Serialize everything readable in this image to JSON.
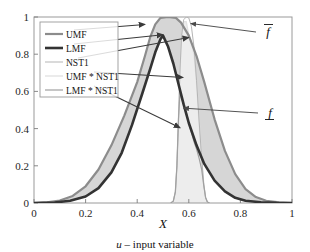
{
  "chart_data": {
    "type": "area",
    "title": "",
    "subtitle": "",
    "xlabel": "X",
    "ylabel": "",
    "caption": "u – input variable",
    "caption_symbol": "u",
    "caption_rest": " – input variable",
    "xlim": [
      0,
      1
    ],
    "ylim": [
      0,
      1
    ],
    "xticks": [
      "0",
      "0.2",
      "0.4",
      "0.6",
      "0.8",
      "1"
    ],
    "xtick_values": [
      0,
      0.2,
      0.4,
      0.6,
      0.8,
      1
    ],
    "yticks": [
      "0",
      "0.2",
      "0.4",
      "0.6",
      "0.8",
      "1"
    ],
    "ytick_values": [
      0,
      0.2,
      0.4,
      0.6,
      0.8,
      1
    ],
    "grid": false,
    "legend_position": "upper-left",
    "fou_fill": "#d6d6d6",
    "series": [
      {
        "name": "UMF",
        "color": "#8c8c8c",
        "width": 2.2,
        "points": [
          [
            0.0,
            0.0
          ],
          [
            0.05,
            0.004
          ],
          [
            0.1,
            0.013
          ],
          [
            0.15,
            0.038
          ],
          [
            0.2,
            0.09
          ],
          [
            0.25,
            0.18
          ],
          [
            0.3,
            0.31
          ],
          [
            0.35,
            0.47
          ],
          [
            0.4,
            0.65
          ],
          [
            0.43,
            0.79
          ],
          [
            0.45,
            0.89
          ],
          [
            0.47,
            0.96
          ],
          [
            0.49,
            0.995
          ],
          [
            0.52,
            1.0
          ],
          [
            0.55,
            0.995
          ],
          [
            0.57,
            0.97
          ],
          [
            0.6,
            0.9
          ],
          [
            0.63,
            0.79
          ],
          [
            0.66,
            0.65
          ],
          [
            0.7,
            0.45
          ],
          [
            0.74,
            0.28
          ],
          [
            0.78,
            0.155
          ],
          [
            0.82,
            0.075
          ],
          [
            0.86,
            0.032
          ],
          [
            0.9,
            0.012
          ],
          [
            0.95,
            0.003
          ],
          [
            1.0,
            0.0
          ]
        ]
      },
      {
        "name": "LMF",
        "color": "#333333",
        "width": 2.6,
        "points": [
          [
            0.0,
            0.0
          ],
          [
            0.08,
            0.003
          ],
          [
            0.14,
            0.012
          ],
          [
            0.2,
            0.035
          ],
          [
            0.25,
            0.08
          ],
          [
            0.3,
            0.165
          ],
          [
            0.34,
            0.27
          ],
          [
            0.38,
            0.42
          ],
          [
            0.42,
            0.59
          ],
          [
            0.45,
            0.72
          ],
          [
            0.47,
            0.81
          ],
          [
            0.49,
            0.88
          ],
          [
            0.5,
            0.9
          ],
          [
            0.52,
            0.84
          ],
          [
            0.54,
            0.75
          ],
          [
            0.56,
            0.64
          ],
          [
            0.58,
            0.53
          ],
          [
            0.6,
            0.43
          ],
          [
            0.63,
            0.31
          ],
          [
            0.66,
            0.21
          ],
          [
            0.7,
            0.12
          ],
          [
            0.74,
            0.062
          ],
          [
            0.78,
            0.028
          ],
          [
            0.82,
            0.012
          ],
          [
            0.88,
            0.004
          ],
          [
            0.94,
            0.001
          ],
          [
            1.0,
            0.0
          ]
        ]
      },
      {
        "name": "NST1",
        "color": "#b5b5b5",
        "width": 1.0,
        "points": [
          [
            0.53,
            0.0
          ],
          [
            0.54,
            0.01
          ],
          [
            0.548,
            0.06
          ],
          [
            0.554,
            0.2
          ],
          [
            0.56,
            0.45
          ],
          [
            0.566,
            0.72
          ],
          [
            0.572,
            0.9
          ],
          [
            0.58,
            0.985
          ],
          [
            0.59,
            1.0
          ],
          [
            0.6,
            0.995
          ],
          [
            0.61,
            0.95
          ],
          [
            0.62,
            0.84
          ],
          [
            0.63,
            0.66
          ],
          [
            0.64,
            0.44
          ],
          [
            0.65,
            0.24
          ],
          [
            0.658,
            0.1
          ],
          [
            0.665,
            0.03
          ],
          [
            0.672,
            0.005
          ],
          [
            0.68,
            0.0
          ]
        ]
      },
      {
        "name": "UMF * NST1",
        "color": "#e2e2e2",
        "width": 1.4,
        "points": [
          [
            0.53,
            0.0
          ],
          [
            0.54,
            0.01
          ],
          [
            0.548,
            0.06
          ],
          [
            0.554,
            0.2
          ],
          [
            0.56,
            0.45
          ],
          [
            0.566,
            0.72
          ],
          [
            0.572,
            0.9
          ],
          [
            0.58,
            0.975
          ],
          [
            0.59,
            0.975
          ],
          [
            0.6,
            0.9
          ],
          [
            0.61,
            0.86
          ],
          [
            0.62,
            0.8
          ],
          [
            0.63,
            0.65
          ],
          [
            0.64,
            0.435
          ],
          [
            0.65,
            0.238
          ],
          [
            0.658,
            0.099
          ],
          [
            0.665,
            0.03
          ],
          [
            0.672,
            0.005
          ],
          [
            0.68,
            0.0
          ]
        ]
      },
      {
        "name": "LMF * NST1",
        "color": "#a0a0a0",
        "width": 1.2,
        "points": [
          [
            0.53,
            0.0
          ],
          [
            0.54,
            0.01
          ],
          [
            0.548,
            0.06
          ],
          [
            0.554,
            0.2
          ],
          [
            0.56,
            0.45
          ],
          [
            0.566,
            0.6
          ],
          [
            0.572,
            0.56
          ],
          [
            0.58,
            0.53
          ],
          [
            0.59,
            0.49
          ],
          [
            0.6,
            0.43
          ],
          [
            0.61,
            0.38
          ],
          [
            0.62,
            0.33
          ],
          [
            0.63,
            0.29
          ],
          [
            0.64,
            0.24
          ],
          [
            0.65,
            0.18
          ],
          [
            0.658,
            0.095
          ],
          [
            0.665,
            0.03
          ],
          [
            0.672,
            0.005
          ],
          [
            0.68,
            0.0
          ]
        ]
      }
    ],
    "annotations": [
      {
        "id": "f-upper",
        "label": "f",
        "accent": "overbar",
        "description": "upper firing level",
        "text_x": 268,
        "text_y": 36,
        "tip_x": 0.6,
        "tip_y": 0.965
      },
      {
        "id": "f-lower",
        "label": "f",
        "accent": "underbar",
        "description": "lower firing level",
        "text_x": 270,
        "text_y": 117,
        "tip_x": 0.572,
        "tip_y": 0.51
      }
    ],
    "callouts": [
      {
        "from": "UMF",
        "start_x": 74,
        "start_y": 30,
        "tip_x": 0.43,
        "tip_y": 0.96
      },
      {
        "from": "LMF",
        "start_x": 74,
        "start_y": 44,
        "tip_x": 0.5,
        "tip_y": 0.905
      },
      {
        "from": "NST1",
        "start_x": 78,
        "start_y": 58,
        "tip_x": 0.6,
        "tip_y": 0.89
      },
      {
        "from": "UMF * NST1",
        "start_x": 94,
        "start_y": 72,
        "tip_x": 0.578,
        "tip_y": 0.675
      },
      {
        "from": "LMF * NST1",
        "start_x": 94,
        "start_y": 86,
        "tip_x": 0.566,
        "tip_y": 0.405
      }
    ]
  },
  "legend": {
    "items": [
      {
        "label": "UMF"
      },
      {
        "label": "LMF"
      },
      {
        "label": "NST1"
      },
      {
        "label": "UMF * NST1"
      },
      {
        "label": "LMF * NST1"
      }
    ]
  }
}
